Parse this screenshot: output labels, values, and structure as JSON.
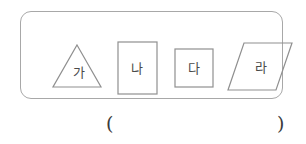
{
  "worksheet": {
    "shape_panel": {
      "border_color": "#a8a8a8",
      "shapes": [
        {
          "name": "triangle",
          "label": "가",
          "stroke": "#8f8f8f"
        },
        {
          "name": "rectangle",
          "label": "나",
          "stroke": "#8f8f8f"
        },
        {
          "name": "square",
          "label": "다",
          "stroke": "#8f8f8f"
        },
        {
          "name": "parallelogram",
          "label": "라",
          "stroke": "#8f8f8f"
        }
      ]
    },
    "answer": {
      "paren_open": "(",
      "paren_close": ")",
      "value": "",
      "placeholder": ""
    }
  }
}
